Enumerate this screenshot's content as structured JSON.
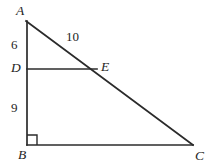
{
  "figure": {
    "background_color": "#ffffff",
    "line_color": "#2b2b2b",
    "vertices": {
      "A": {
        "label": "A",
        "x": 26,
        "y": 21
      },
      "B": {
        "label": "B",
        "x": 27,
        "y": 145
      },
      "C": {
        "label": "C",
        "x": 193,
        "y": 145
      },
      "D": {
        "label": "D",
        "x": 27,
        "y": 69
      },
      "E": {
        "label": "E",
        "x": 96,
        "y": 69
      }
    },
    "segments": [
      {
        "name": "AB",
        "from": "A",
        "to": "B"
      },
      {
        "name": "BC",
        "from": "B",
        "to": "C"
      },
      {
        "name": "AC",
        "from": "A",
        "to": "C"
      },
      {
        "name": "DE",
        "from": "D",
        "to": "E"
      }
    ],
    "measure_labels": {
      "AD": "6",
      "DB": "9",
      "AE": "10"
    },
    "right_angle": {
      "at": "B",
      "marker": "square",
      "size": 10
    }
  }
}
